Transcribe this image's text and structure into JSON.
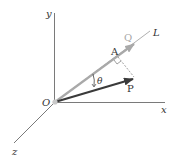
{
  "diagram": {
    "type": "3d-vector-projection",
    "axes": {
      "x_label": "x",
      "y_label": "y",
      "z_label": "z"
    },
    "origin_label": "O",
    "line_label": "L",
    "vectors": [
      {
        "name": "Q",
        "label": "Q",
        "color": "#a9a9a9",
        "role": "along line L"
      },
      {
        "name": "P",
        "label": "P",
        "color": "#3a3a3a",
        "role": "vector projected onto L"
      }
    ],
    "point_label": "A",
    "angle_label": "θ",
    "colors": {
      "axes": "#7a7a7a",
      "line_L": "#9a9a9a",
      "Q": "#a9a9a9",
      "P": "#3a3a3a",
      "dashed": "#777777",
      "origin_dot": "#c8c8c8"
    }
  }
}
